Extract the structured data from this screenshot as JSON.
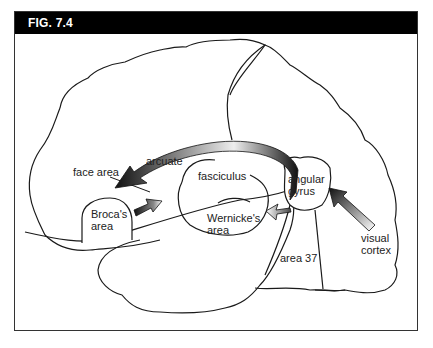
{
  "figure": {
    "title": "FIG. 7.4"
  },
  "labels": {
    "arcuate": "arcuate",
    "face_area": "face area",
    "fasciculus": "fasciculus",
    "broca_line1": "Broca's",
    "broca_line2": "area",
    "wernicke_line1": "Wernicke's",
    "wernicke_line2": "area",
    "angular_line1": "angular",
    "angular_line2": "gyrus",
    "visual_line1": "visual",
    "visual_line2": "cortex",
    "area37": "area 37"
  },
  "colors": {
    "header_bg": "#000000",
    "header_text": "#ffffff",
    "outline": "#1a1a1a",
    "arrow_dark": "#111111",
    "arrow_light": "#ffffff"
  }
}
